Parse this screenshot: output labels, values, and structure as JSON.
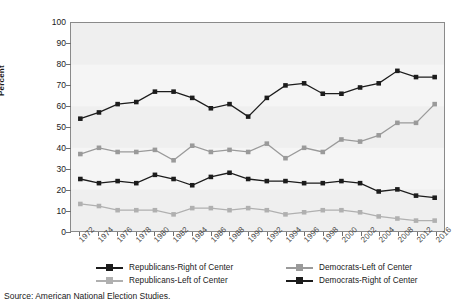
{
  "figure": {
    "title_partial": "",
    "source": "Source: American National Election Studies."
  },
  "axes": {
    "ylabel": "Percent",
    "yticks": [
      "0",
      "10",
      "20",
      "30",
      "40",
      "50",
      "60",
      "70",
      "80",
      "90",
      "100"
    ],
    "xticks": [
      "1972",
      "1974",
      "1976",
      "1978",
      "1980",
      "1982",
      "1984",
      "1986",
      "1988",
      "1990",
      "1992",
      "1994",
      "1996",
      "1998",
      "2000",
      "2002",
      "2004",
      "2008",
      "2012",
      "2016"
    ]
  },
  "legend": {
    "items": [
      {
        "label": "Republicans-Right of Center",
        "color": "#1c1c1c",
        "row": 0,
        "col": 0
      },
      {
        "label": "Democrats-Left of Center",
        "color": "#9a9a9a",
        "row": 0,
        "col": 1
      },
      {
        "label": "Republicans-Left of Center",
        "color": "#b0b0b0",
        "row": 1,
        "col": 0
      },
      {
        "label": "Democrats-Right of Center",
        "color": "#1c1c1c",
        "row": 1,
        "col": 1
      }
    ]
  },
  "chart_data": {
    "type": "line",
    "title": "",
    "xlabel": "",
    "ylabel": "Percent",
    "ylim": [
      0,
      100
    ],
    "ytick_step": 10,
    "grid": false,
    "legend_position": "bottom",
    "marker": "square",
    "categories": [
      "1972",
      "1974",
      "1976",
      "1978",
      "1980",
      "1982",
      "1984",
      "1986",
      "1988",
      "1990",
      "1992",
      "1994",
      "1996",
      "1998",
      "2000",
      "2002",
      "2004",
      "2008",
      "2012",
      "2016"
    ],
    "series": [
      {
        "name": "Republicans-Right of Center",
        "color": "#1c1c1c",
        "values": [
          54,
          57,
          61,
          62,
          67,
          67,
          64,
          59,
          61,
          55,
          64,
          70,
          71,
          66,
          66,
          69,
          71,
          77,
          74,
          74
        ]
      },
      {
        "name": "Democrats-Left of Center",
        "color": "#9a9a9a",
        "values": [
          37,
          40,
          38,
          38,
          39,
          34,
          41,
          38,
          39,
          38,
          42,
          35,
          40,
          38,
          44,
          43,
          46,
          52,
          52,
          61
        ]
      },
      {
        "name": "Democrats-Right of Center",
        "color": "#1c1c1c",
        "values": [
          25,
          23,
          24,
          23,
          27,
          25,
          22,
          26,
          28,
          25,
          24,
          24,
          23,
          23,
          24,
          23,
          19,
          20,
          17,
          16
        ]
      },
      {
        "name": "Republicans-Left of Center",
        "color": "#b0b0b0",
        "values": [
          13,
          12,
          10,
          10,
          10,
          8,
          11,
          11,
          10,
          11,
          10,
          8,
          9,
          10,
          10,
          9,
          7,
          6,
          5,
          5
        ]
      }
    ]
  }
}
